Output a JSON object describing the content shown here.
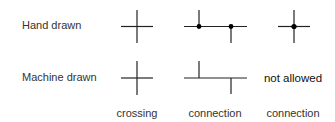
{
  "rows": [
    {
      "label": "Hand drawn"
    },
    {
      "label": "Machine drawn"
    }
  ],
  "columns": [
    {
      "label": "crossing"
    },
    {
      "label": "connection"
    },
    {
      "label": "connection"
    }
  ],
  "cells": {
    "machine_connection_right": "not allowed"
  },
  "colors": {
    "line": "#222222",
    "dot": "#000000",
    "text": "#333333"
  }
}
